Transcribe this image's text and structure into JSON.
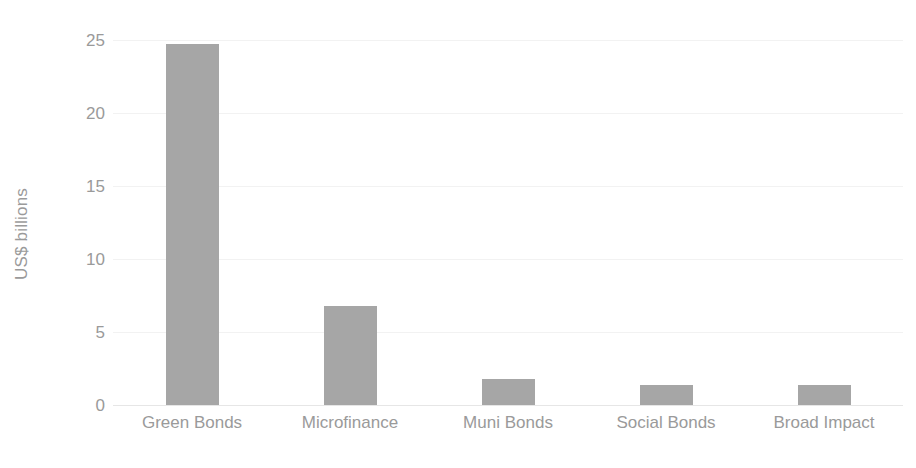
{
  "chart_data": {
    "type": "bar",
    "title": "",
    "subtitle": "",
    "xlabel": "",
    "ylabel": "US$ billions",
    "categories": [
      "Green Bonds",
      "Microfinance",
      "Muni Bonds",
      "Social Bonds",
      "Broad Impact"
    ],
    "values": [
      24.7,
      6.8,
      1.8,
      1.4,
      1.4
    ],
    "ylim": [
      0,
      25
    ],
    "yticks": [
      0,
      5,
      10,
      15,
      20,
      25
    ],
    "ytick_labels": [
      "0",
      "5",
      "10",
      "15",
      "20",
      "25"
    ],
    "grid": true,
    "grid_axis": "y",
    "legend": false,
    "legend_position": "none",
    "series": [
      {
        "name": "US$ billions",
        "values": [
          24.7,
          6.8,
          1.8,
          1.4,
          1.4
        ]
      }
    ]
  },
  "style": {
    "bar_color": "#a6a6a6",
    "grid_color": "#f2f2f2",
    "axis_line_color": "#e6e6e6",
    "tick_label_color": "#9a9a9a",
    "axis_title_color": "#9a9a9a",
    "background": "#ffffff"
  }
}
